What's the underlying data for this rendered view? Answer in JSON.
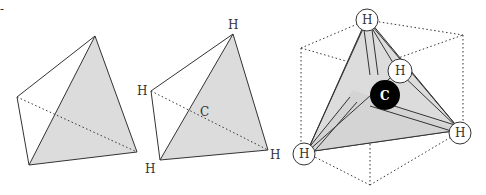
{
  "figure": {
    "colors": {
      "face": "#dcdcdc",
      "line": "#333333",
      "carbon": "#000000",
      "atom_fill": "#ffffff"
    },
    "corner_mark": "-",
    "panels": [
      {
        "id": "plain-tetrahedron",
        "labels": []
      },
      {
        "id": "labeled-tetrahedron",
        "labels": {
          "top": "H",
          "left": "H",
          "bottom_left": "H",
          "right": "H",
          "center": "C"
        }
      },
      {
        "id": "methane-in-cube",
        "labels": {
          "top": "H",
          "front": "H",
          "left": "H",
          "right": "H",
          "carbon": "C"
        }
      }
    ]
  }
}
